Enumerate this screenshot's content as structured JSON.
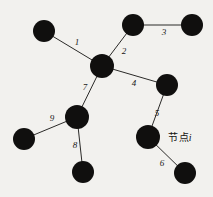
{
  "figure": {
    "width": 213,
    "height": 197,
    "background_color": "#f2f1ee",
    "node_color": "#100f0e",
    "edge_color": "#2b2a28"
  },
  "annotation": {
    "text_cn": "节点",
    "text_var": "i",
    "full_text": "节点i",
    "x": 180,
    "y": 136
  },
  "nodes": [
    {
      "id": "n1",
      "name": "top-left-node",
      "x": 44,
      "y": 31,
      "r": 11
    },
    {
      "id": "n2",
      "name": "center-hub-node",
      "x": 102,
      "y": 66,
      "r": 12
    },
    {
      "id": "n3",
      "name": "top-middle-node",
      "x": 133,
      "y": 25,
      "r": 11
    },
    {
      "id": "n4",
      "name": "top-right-node",
      "x": 192,
      "y": 25,
      "r": 11
    },
    {
      "id": "n5",
      "name": "right-middle-node",
      "x": 167,
      "y": 85,
      "r": 11
    },
    {
      "id": "n6",
      "name": "annotated-node-i",
      "x": 148,
      "y": 137,
      "r": 12
    },
    {
      "id": "n7",
      "name": "bottom-right-node",
      "x": 185,
      "y": 173,
      "r": 11
    },
    {
      "id": "n8",
      "name": "lower-left-hub-node",
      "x": 77,
      "y": 117,
      "r": 12
    },
    {
      "id": "n9",
      "name": "far-left-node",
      "x": 24,
      "y": 139,
      "r": 11
    },
    {
      "id": "n10",
      "name": "bottom-left-node",
      "x": 83,
      "y": 172,
      "r": 11
    }
  ],
  "edges": [
    {
      "label": "1",
      "from": "n1",
      "to": "n2",
      "label_x": 77,
      "label_y": 42
    },
    {
      "label": "2",
      "from": "n3",
      "to": "n2",
      "label_x": 124,
      "label_y": 51
    },
    {
      "label": "3",
      "from": "n3",
      "to": "n4",
      "label_x": 164,
      "label_y": 32
    },
    {
      "label": "4",
      "from": "n2",
      "to": "n5",
      "label_x": 134,
      "label_y": 83
    },
    {
      "label": "5",
      "from": "n5",
      "to": "n6",
      "label_x": 157,
      "label_y": 113
    },
    {
      "label": "6",
      "from": "n6",
      "to": "n7",
      "label_x": 162,
      "label_y": 163
    },
    {
      "label": "7",
      "from": "n2",
      "to": "n8",
      "label_x": 85,
      "label_y": 87
    },
    {
      "label": "8",
      "from": "n8",
      "to": "n10",
      "label_x": 75,
      "label_y": 145
    },
    {
      "label": "9",
      "from": "n9",
      "to": "n8",
      "label_x": 52,
      "label_y": 118
    }
  ]
}
